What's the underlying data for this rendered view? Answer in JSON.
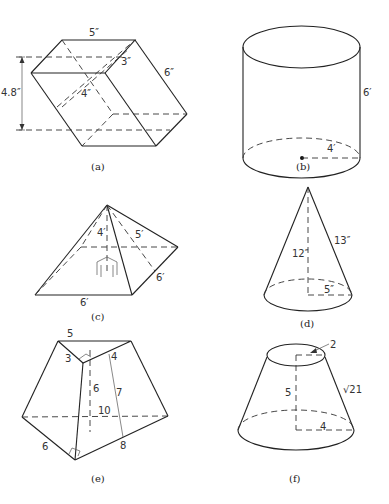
{
  "figures": {
    "a": {
      "caption": "(a)",
      "shape": "oblique rectangular parallelepiped",
      "labels": {
        "top": "5″",
        "depth": "3″",
        "slant_edge": "6″",
        "inner": "4″",
        "height": "4.8″"
      }
    },
    "b": {
      "caption": "(b)",
      "shape": "right circular cylinder",
      "labels": {
        "height": "6′",
        "radius": "4′"
      }
    },
    "c": {
      "caption": "(c)",
      "shape": "square pyramid",
      "labels": {
        "height": "4′",
        "slant_height": "5′",
        "side_right": "6′",
        "side_front": "6′"
      }
    },
    "d": {
      "caption": "(d)",
      "shape": "right circular cone",
      "labels": {
        "height": "12″",
        "slant": "13″",
        "radius": "5″"
      }
    },
    "e": {
      "caption": "(e)",
      "shape": "frustum of triangular pyramid",
      "labels": {
        "top": "5",
        "top_left": "3",
        "top_right": "4",
        "height": "6",
        "slant": "7",
        "base_back": "10",
        "base_left": "6",
        "base_right": "8"
      }
    },
    "f": {
      "caption": "(f)",
      "shape": "frustum of cone",
      "labels": {
        "top_radius": "2",
        "height": "5",
        "slant": "√21",
        "bottom_radius": "4"
      }
    }
  }
}
